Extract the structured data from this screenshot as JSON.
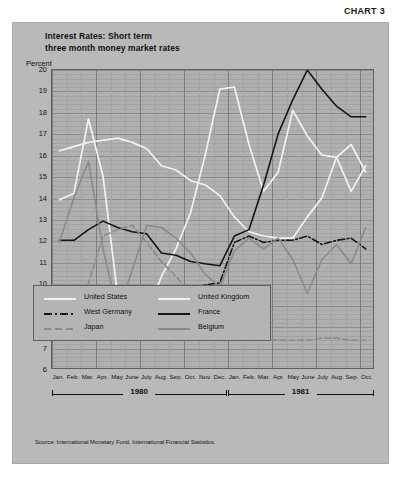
{
  "chart_label": "CHART 3",
  "title": {
    "line1": "Interest Rates: Short term",
    "line2": "three month money market rates"
  },
  "y_axis_label": "Percent",
  "source": "Source: International Monetary Fund, International Financial Statistics.",
  "legend": {
    "items": [
      {
        "label": "United States",
        "style": "solid-white",
        "color": "#f2f2f2"
      },
      {
        "label": "United Kingdom",
        "style": "solid-white",
        "color": "#f2f2f2"
      },
      {
        "label": "West Germany",
        "style": "dashdot-black",
        "color": "#151515"
      },
      {
        "label": "France",
        "style": "solid-black",
        "color": "#151515"
      },
      {
        "label": "Japan",
        "style": "dashed-gray",
        "color": "#8a8a8a"
      },
      {
        "label": "Belgium",
        "style": "solid-gray",
        "color": "#8a8a8a"
      }
    ]
  },
  "years": [
    {
      "label": "1980",
      "start_index": 0,
      "end_index": 11
    },
    {
      "label": "1981",
      "start_index": 12,
      "end_index": 21
    }
  ],
  "chart_data": {
    "type": "line",
    "title": "Interest Rates: Short term three month money market rates",
    "subtitle": "three month money market rates",
    "xlabel": "",
    "ylabel": "Percent",
    "ylim": [
      6,
      20
    ],
    "yticks": [
      6,
      7,
      8,
      9,
      10,
      11,
      12,
      13,
      14,
      15,
      16,
      17,
      18,
      19,
      20
    ],
    "grid": true,
    "legend_position": "inside-bottom-left",
    "x": [
      "Jan. 1980",
      "Feb. 1980",
      "Mar. 1980",
      "Apr. 1980",
      "May 1980",
      "June 1980",
      "July 1980",
      "Aug. 1980",
      "Sep. 1980",
      "Oct. 1980",
      "Nov. 1980",
      "Dec. 1980",
      "Jan. 1981",
      "Feb. 1981",
      "Mar. 1981",
      "Apr. 1981",
      "May 1981",
      "June 1981",
      "July 1981",
      "Aug. 1981",
      "Sep. 1981",
      "Oct. 1981"
    ],
    "categories": [
      "Jan.",
      "Feb.",
      "Mar.",
      "Apr.",
      "May",
      "June",
      "July",
      "Aug.",
      "Sep.",
      "Oct.",
      "Nov.",
      "Dec.",
      "Jan.",
      "Feb.",
      "Mar.",
      "Apr.",
      "May",
      "June",
      "July",
      "Aug.",
      "Sep.",
      "Oct."
    ],
    "series": [
      {
        "name": "United States",
        "color": "#f2f2f2",
        "style": "solid-white",
        "values": [
          13.9,
          14.2,
          17.7,
          15.0,
          9.4,
          8.2,
          8.5,
          10.3,
          11.6,
          13.3,
          16.0,
          19.1,
          19.2,
          16.5,
          14.3,
          15.2,
          18.1,
          16.9,
          16.0,
          15.9,
          14.3,
          15.5
        ]
      },
      {
        "name": "United Kingdom",
        "color": "#f2f2f2",
        "style": "solid-white",
        "values": [
          16.2,
          16.4,
          16.6,
          16.7,
          16.8,
          16.6,
          16.3,
          15.5,
          15.3,
          14.8,
          14.6,
          14.1,
          13.1,
          12.4,
          12.2,
          12.1,
          12.1,
          13.1,
          14.0,
          15.9,
          16.5,
          15.2
        ]
      },
      {
        "name": "West Germany",
        "color": "#151515",
        "style": "dashdot-black",
        "values": [
          8.2,
          8.0,
          8.6,
          9.2,
          9.5,
          9.7,
          9.6,
          9.3,
          9.4,
          9.7,
          9.9,
          10.0,
          11.9,
          12.2,
          11.9,
          12.0,
          12.0,
          12.2,
          11.8,
          12.0,
          12.1,
          11.6
        ]
      },
      {
        "name": "France",
        "color": "#151515",
        "style": "solid-black",
        "values": [
          12.0,
          12.0,
          12.5,
          12.9,
          12.6,
          12.4,
          12.3,
          11.4,
          11.3,
          11.0,
          10.9,
          10.8,
          12.2,
          12.5,
          14.6,
          17.0,
          18.6,
          20.0,
          19.1,
          18.3,
          17.8,
          17.8
        ]
      },
      {
        "name": "Japan",
        "color": "#8a8a8a",
        "style": "dashed-gray",
        "values": [
          7.3,
          8.1,
          10.0,
          12.2,
          12.5,
          12.7,
          11.9,
          11.0,
          10.3,
          9.5,
          8.9,
          8.2,
          7.9,
          7.5,
          7.4,
          7.3,
          7.3,
          7.3,
          7.4,
          7.4,
          7.3,
          7.3
        ]
      },
      {
        "name": "Belgium",
        "color": "#8a8a8a",
        "style": "solid-gray",
        "values": [
          11.9,
          14.0,
          15.7,
          11.6,
          8.6,
          10.6,
          12.7,
          12.6,
          12.1,
          11.4,
          10.4,
          9.8,
          11.5,
          12.1,
          11.6,
          12.1,
          11.1,
          9.5,
          11.1,
          11.8,
          10.9,
          12.6
        ]
      }
    ]
  }
}
